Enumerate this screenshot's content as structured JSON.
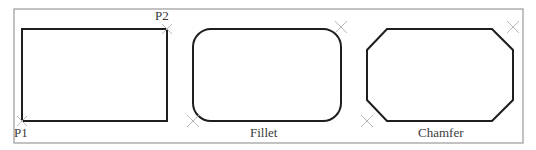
{
  "figure": {
    "frame": {
      "x1": 14,
      "y1": 9,
      "x2": 523,
      "y2": 143,
      "color": "#9a9a9a"
    },
    "shape_color": "#1e1e1e",
    "marker_color": "#b8b8b8",
    "panels": [
      {
        "id": "rectangle",
        "caption": "",
        "points": {
          "p1": "P1",
          "p2": "P2"
        },
        "rect": {
          "x": 22,
          "y": 29,
          "w": 145,
          "h": 92
        },
        "markers": [
          {
            "x": 22,
            "y": 121
          },
          {
            "x": 167,
            "y": 29
          }
        ]
      },
      {
        "id": "fillet",
        "caption": "Fillet",
        "rect": {
          "x": 193,
          "y": 29,
          "w": 148,
          "h": 92,
          "radius": 18
        },
        "markers": [
          {
            "x": 193,
            "y": 121
          },
          {
            "x": 341,
            "y": 27
          }
        ]
      },
      {
        "id": "chamfer",
        "caption": "Chamfer",
        "polygon": "387,29 492,29 513,50 513,100 492,121 387,121 367,100 367,50",
        "markers": [
          {
            "x": 367,
            "y": 121
          },
          {
            "x": 513,
            "y": 27
          }
        ]
      }
    ]
  }
}
